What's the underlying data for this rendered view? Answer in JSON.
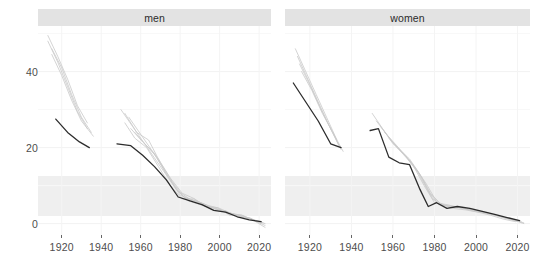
{
  "figure": {
    "background": "#ffffff",
    "strip_background": "#e3e3e3",
    "axis_text_color": "#4d4d4d",
    "highlight_color": "#1a1a1a",
    "faded_color": "#c9c9c9"
  },
  "panels": [
    {
      "id": "men",
      "label": "men"
    },
    {
      "id": "women",
      "label": "women"
    }
  ],
  "axes": {
    "y": {
      "ticks": [
        0,
        20,
        40
      ],
      "tick_labels": [
        "0",
        "20",
        "40"
      ],
      "limits": [
        -3,
        52
      ]
    },
    "x": {
      "ticks": [
        1920,
        1940,
        1960,
        1980,
        2000,
        2020
      ],
      "tick_labels": [
        "1920",
        "1940",
        "1960",
        "1980",
        "2000",
        "2020"
      ],
      "limits": [
        1908,
        2026
      ]
    }
  },
  "chart_data": {
    "type": "line",
    "title": "",
    "subtitle": "",
    "xlabel": "",
    "ylabel": "",
    "xlim": [
      1908,
      2026
    ],
    "ylim": [
      -3,
      52
    ],
    "grid": true,
    "legend": "none",
    "facet_by": "sex",
    "facets": [
      "men",
      "women"
    ],
    "panels": [
      {
        "facet": "men",
        "series": [
          {
            "name": "cohort-1913-a",
            "highlight": false,
            "x": [
              1913,
              1918,
              1923,
              1928,
              1933
            ],
            "y": [
              49.5,
              44.0,
              38.0,
              31.0,
              26.5
            ]
          },
          {
            "name": "cohort-1913-b",
            "highlight": false,
            "x": [
              1913,
              1918,
              1923,
              1928,
              1933
            ],
            "y": [
              48.0,
              42.5,
              36.0,
              29.5,
              25.0
            ]
          },
          {
            "name": "cohort-1915-a",
            "highlight": false,
            "x": [
              1915,
              1920,
              1925,
              1930,
              1935
            ],
            "y": [
              46.0,
              41.0,
              34.0,
              28.0,
              24.0
            ]
          },
          {
            "name": "cohort-1915-b",
            "highlight": false,
            "x": [
              1915,
              1920,
              1925,
              1930,
              1936
            ],
            "y": [
              44.5,
              39.0,
              32.5,
              27.0,
              23.0
            ]
          },
          {
            "name": "cohort-1917-dark",
            "highlight": true,
            "x": [
              1917,
              1923,
              1929,
              1934
            ],
            "y": [
              27.5,
              24.0,
              21.5,
              20.0
            ]
          },
          {
            "name": "cohort-1946-dark",
            "highlight": true,
            "x": [
              1948,
              1955,
              1961,
              1967,
              1973,
              1979,
              1985,
              1991,
              1997,
              2003,
              2009,
              2015,
              2021
            ],
            "y": [
              21.0,
              20.5,
              18.0,
              15.0,
              11.5,
              7.0,
              6.0,
              5.0,
              3.5,
              3.0,
              1.8,
              1.0,
              0.5
            ]
          },
          {
            "name": "cohort-1948",
            "highlight": false,
            "x": [
              1950,
              1956,
              1962,
              1968,
              1974,
              1980,
              1986,
              1992,
              1998,
              2004,
              2010,
              2016,
              2022
            ],
            "y": [
              30.0,
              25.5,
              21.0,
              16.5,
              12.0,
              7.5,
              6.2,
              5.2,
              3.8,
              3.0,
              2.0,
              1.2,
              0.2
            ]
          },
          {
            "name": "cohort-1950",
            "highlight": false,
            "x": [
              1952,
              1958,
              1964,
              1970,
              1976,
              1982,
              1988,
              1994,
              2000,
              2006,
              2012,
              2018,
              2023
            ],
            "y": [
              29.0,
              24.0,
              22.0,
              16.0,
              11.0,
              6.8,
              6.0,
              4.8,
              4.0,
              2.6,
              2.0,
              0.8,
              0.0
            ]
          },
          {
            "name": "cohort-1952",
            "highlight": false,
            "x": [
              1952,
              1957,
              1963,
              1969,
              1975,
              1981,
              1987,
              1993,
              1999,
              2005,
              2011,
              2017,
              2023
            ],
            "y": [
              26.5,
              22.5,
              20.0,
              15.0,
              10.0,
              6.5,
              6.5,
              4.5,
              4.2,
              2.2,
              2.3,
              1.0,
              -0.5
            ]
          },
          {
            "name": "cohort-1954",
            "highlight": false,
            "x": [
              1954,
              1960,
              1966,
              1972,
              1978,
              1984,
              1990,
              1996,
              2002,
              2008,
              2014,
              2020
            ],
            "y": [
              28.0,
              23.5,
              19.0,
              14.0,
              9.0,
              6.0,
              5.0,
              4.2,
              3.2,
              2.4,
              1.4,
              0.6
            ]
          },
          {
            "name": "cohort-1956",
            "highlight": false,
            "x": [
              1955,
              1961,
              1967,
              1973,
              1979,
              1985,
              1991,
              1997,
              2003,
              2009,
              2015,
              2021
            ],
            "y": [
              25.0,
              21.5,
              18.5,
              13.0,
              8.5,
              6.4,
              5.4,
              3.6,
              3.4,
              1.6,
              1.6,
              0.0
            ]
          },
          {
            "name": "cohort-1958",
            "highlight": false,
            "x": [
              1957,
              1963,
              1969,
              1975,
              1981,
              1987,
              1993,
              1999,
              2005,
              2011,
              2017,
              2023
            ],
            "y": [
              24.0,
              20.5,
              17.0,
              12.0,
              8.0,
              6.6,
              4.6,
              3.9,
              2.8,
              2.2,
              0.9,
              -1.0
            ]
          }
        ]
      },
      {
        "facet": "women",
        "series": [
          {
            "name": "cohort-1913-a",
            "highlight": false,
            "x": [
              1913,
              1918,
              1923,
              1928,
              1933
            ],
            "y": [
              46.0,
              40.0,
              34.0,
              28.0,
              22.0
            ]
          },
          {
            "name": "cohort-1913-b",
            "highlight": false,
            "x": [
              1914,
              1919,
              1924,
              1929,
              1934
            ],
            "y": [
              44.0,
              38.0,
              32.0,
              26.0,
              20.5
            ]
          },
          {
            "name": "cohort-1915-a",
            "highlight": false,
            "x": [
              1915,
              1920,
              1925,
              1930,
              1935
            ],
            "y": [
              42.0,
              36.5,
              30.5,
              25.0,
              19.5
            ]
          },
          {
            "name": "cohort-1915-b",
            "highlight": false,
            "x": [
              1916,
              1921,
              1926,
              1931,
              1936
            ],
            "y": [
              40.0,
              35.0,
              29.0,
              24.0,
              19.0
            ]
          },
          {
            "name": "cohort-1912-dark",
            "highlight": true,
            "x": [
              1912,
              1918,
              1924,
              1930,
              1935
            ],
            "y": [
              37.0,
              32.0,
              27.0,
              21.0,
              20.0
            ]
          },
          {
            "name": "cohort-1948-dark",
            "highlight": true,
            "x": [
              1949,
              1953,
              1958,
              1963,
              1968,
              1973,
              1977,
              1981,
              1986,
              1991,
              1997,
              2003,
              2009,
              2015,
              2021
            ],
            "y": [
              24.5,
              25.0,
              17.5,
              16.0,
              15.5,
              9.0,
              4.5,
              5.5,
              4.0,
              4.5,
              4.0,
              3.2,
              2.4,
              1.6,
              0.8
            ]
          },
          {
            "name": "cohort-1950",
            "highlight": false,
            "x": [
              1950,
              1955,
              1960,
              1965,
              1970,
              1975,
              1980,
              1986,
              1992,
              1998,
              2004,
              2010,
              2016,
              2022
            ],
            "y": [
              29.0,
              25.0,
              21.0,
              18.5,
              15.0,
              10.0,
              5.5,
              5.0,
              4.2,
              3.6,
              3.0,
              2.2,
              1.2,
              0.4
            ]
          },
          {
            "name": "cohort-1952",
            "highlight": false,
            "x": [
              1952,
              1957,
              1962,
              1967,
              1972,
              1977,
              1982,
              1988,
              1994,
              2000,
              2006,
              2012,
              2018,
              2023
            ],
            "y": [
              27.0,
              23.5,
              20.0,
              17.0,
              13.5,
              8.5,
              5.0,
              4.6,
              4.0,
              3.4,
              2.6,
              1.8,
              1.0,
              0.2
            ]
          },
          {
            "name": "cohort-1954",
            "highlight": false,
            "x": [
              1954,
              1959,
              1964,
              1969,
              1974,
              1979,
              1984,
              1990,
              1996,
              2002,
              2008,
              2014,
              2020
            ],
            "y": [
              25.5,
              22.0,
              19.0,
              16.0,
              12.0,
              6.5,
              4.8,
              4.4,
              3.8,
              3.0,
              2.4,
              1.4,
              0.6
            ]
          },
          {
            "name": "cohort-1956",
            "highlight": false,
            "x": [
              1956,
              1961,
              1966,
              1971,
              1976,
              1981,
              1987,
              1993,
              1999,
              2005,
              2011,
              2017,
              2023
            ],
            "y": [
              24.0,
              21.0,
              18.0,
              14.5,
              10.5,
              5.8,
              4.4,
              4.2,
              3.2,
              2.8,
              2.0,
              1.1,
              0.0
            ]
          },
          {
            "name": "cohort-1958",
            "highlight": false,
            "x": [
              1958,
              1963,
              1968,
              1973,
              1978,
              1983,
              1989,
              1995,
              2001,
              2007,
              2013,
              2019
            ],
            "y": [
              22.5,
              19.5,
              17.0,
              13.0,
              8.0,
              5.2,
              4.0,
              3.6,
              3.0,
              2.2,
              1.2,
              0.5
            ]
          }
        ]
      }
    ]
  }
}
